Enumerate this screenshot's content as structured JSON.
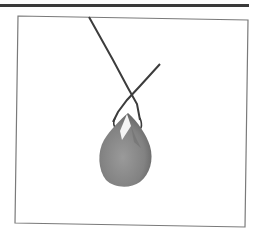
{
  "image": {
    "subject": "pendant-on-cord",
    "colors": {
      "top_rule": "#3a3a3a",
      "frame_border": "#7a7a7a",
      "cord": "#3c3c3c",
      "stone_main": "#8a8a8a",
      "stone_dark": "#6e6e6e",
      "stone_highlight": "#f4f4f4"
    }
  }
}
